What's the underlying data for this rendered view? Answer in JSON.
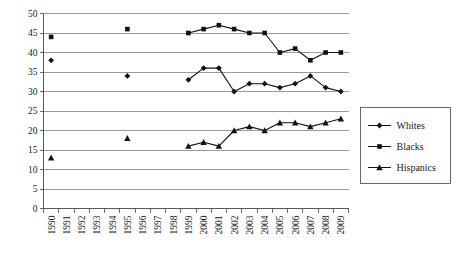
{
  "chart_data": {
    "type": "line",
    "title": "",
    "subtitle": "",
    "xlabel": "",
    "ylabel": "",
    "xlim": [
      1990,
      2009
    ],
    "ylim": [
      0,
      50
    ],
    "y_ticks": [
      0,
      5,
      10,
      15,
      20,
      25,
      30,
      35,
      40,
      45,
      50
    ],
    "grid": "horizontal",
    "legend_position": "right",
    "categories": [
      "1990",
      "1991",
      "1992",
      "1993",
      "1994",
      "1995",
      "1996",
      "1997",
      "1998",
      "1999",
      "2000",
      "2001",
      "2002",
      "2003",
      "2004",
      "2005",
      "2006",
      "2007",
      "2008",
      "2009"
    ],
    "series": [
      {
        "name": "Whites",
        "marker": "diamond",
        "color": "#111111",
        "values": [
          38,
          null,
          null,
          null,
          null,
          34,
          null,
          null,
          null,
          33,
          36,
          36,
          30,
          32,
          32,
          31,
          32,
          34,
          31,
          30
        ]
      },
      {
        "name": "Blacks",
        "marker": "square",
        "color": "#111111",
        "values": [
          44,
          null,
          null,
          null,
          null,
          46,
          null,
          null,
          null,
          45,
          46,
          47,
          46,
          45,
          45,
          40,
          41,
          38,
          40,
          40
        ]
      },
      {
        "name": "Hispanics",
        "marker": "triangle",
        "color": "#111111",
        "values": [
          13,
          null,
          null,
          null,
          null,
          18,
          null,
          null,
          null,
          16,
          17,
          16,
          20,
          21,
          20,
          22,
          22,
          21,
          22,
          23
        ]
      }
    ]
  },
  "legend": {
    "entries": [
      {
        "label": "Whites",
        "marker": "diamond"
      },
      {
        "label": "Blacks",
        "marker": "square"
      },
      {
        "label": "Hispanics",
        "marker": "triangle"
      }
    ]
  }
}
